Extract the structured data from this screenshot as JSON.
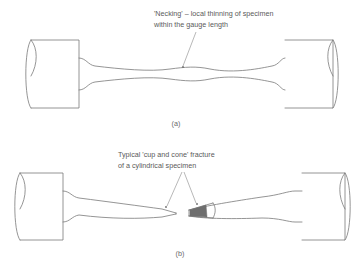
{
  "figure": {
    "background_color": "#ffffff",
    "outline_color": "#7a7a7a",
    "text_color": "#5a5a5a",
    "fracture_shade_color": "#6e6e6e",
    "annotations": {
      "necking": {
        "line1": "'Necking' – local thinning of specimen",
        "line2": "within the gauge length"
      },
      "fracture": {
        "line1": "Typical 'cup and cone' fracture",
        "line2": "of a cylindrical specimen"
      }
    },
    "panels": [
      {
        "id": "a",
        "label": "(a)",
        "description": "Tensile test specimen showing necking in the gauge length"
      },
      {
        "id": "b",
        "label": "(b)",
        "description": "Fractured tensile specimen showing cup and cone fracture surfaces"
      }
    ]
  }
}
